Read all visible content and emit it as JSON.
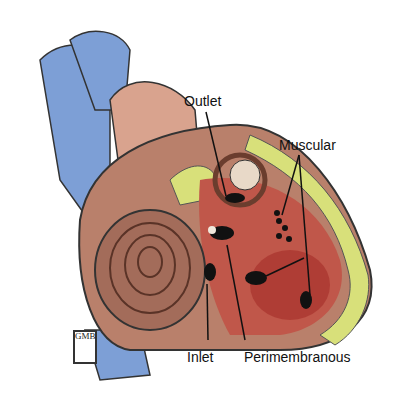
{
  "diagram": {
    "labels": {
      "outlet": "Outlet",
      "muscular": "Muscular",
      "inlet": "Inlet",
      "perimembranous": "Perimembranous"
    },
    "signature": "GMB",
    "colors": {
      "vessel_blue": "#7d9fd6",
      "myocardium": "#b9806b",
      "septum_red": "#b8433a",
      "fat_yellow": "#d8e07a",
      "defect_black": "#111111"
    }
  }
}
